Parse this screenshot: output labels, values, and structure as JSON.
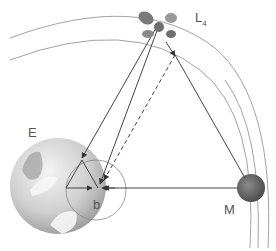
{
  "labels": {
    "earth": "E",
    "moon": "M",
    "lagrange": "L",
    "lagrange_sub": "4",
    "barycenter": "b"
  },
  "colors": {
    "orbit": "#8a8a8a",
    "line": "#444444",
    "earth": "#c8c8c8",
    "moon": "#6a6a6a"
  }
}
